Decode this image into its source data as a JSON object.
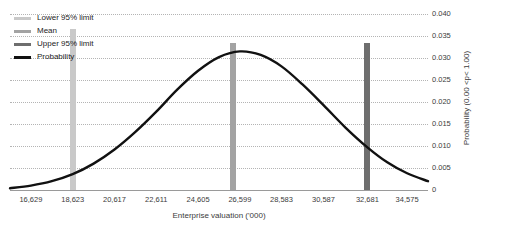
{
  "chart_data": {
    "type": "line",
    "title": "",
    "xlabel": "Enterprise valuation ('000)",
    "ylabel": "Probability (0.00 <p< 1.00)",
    "grid": true,
    "legend_position": "top-left",
    "xlim": [
      15632,
      35572
    ],
    "ylim": [
      0,
      0.04
    ],
    "x_tick_labels": [
      "16,629",
      "18,623",
      "20,617",
      "22,611",
      "24,605",
      "26,599",
      "28,583",
      "30,587",
      "32,681",
      "34,575"
    ],
    "x_tick_values": [
      16629,
      18623,
      20617,
      22611,
      24605,
      26599,
      28583,
      30587,
      32681,
      34575
    ],
    "y_tick_labels": [
      "0",
      "0.005",
      "0.010",
      "0.015",
      "0.020",
      "0.025",
      "0.030",
      "0.035",
      "0.040"
    ],
    "y_tick_values": [
      0,
      0.005,
      0.01,
      0.015,
      0.02,
      0.025,
      0.03,
      0.035,
      0.04
    ],
    "series": [
      {
        "name": "Probability",
        "type": "line",
        "color": "#111111",
        "x": [
          15632,
          16629,
          17626,
          18623,
          19620,
          20617,
          21614,
          22611,
          23608,
          24605,
          25602,
          26599,
          27591,
          28583,
          29585,
          30587,
          31634,
          32681,
          33628,
          34575,
          35572
        ],
        "values": [
          0.0004,
          0.001,
          0.002,
          0.0036,
          0.006,
          0.0092,
          0.0132,
          0.0178,
          0.0228,
          0.0271,
          0.0302,
          0.0315,
          0.0307,
          0.0281,
          0.024,
          0.0193,
          0.0142,
          0.0097,
          0.0063,
          0.0038,
          0.002
        ]
      }
    ],
    "markers": [
      {
        "name": "Lower 95% limit",
        "x": 18623,
        "color": "#c9c9c9",
        "top_value": 0.0365
      },
      {
        "name": "Mean",
        "x": 26270,
        "color": "#a3a3a3",
        "top_value": 0.0335
      },
      {
        "name": "Upper 95% limit",
        "x": 32681,
        "color": "#6e6e6e",
        "top_value": 0.0335
      }
    ],
    "legend": [
      {
        "label": "Lower 95% limit",
        "color": "#c9c9c9"
      },
      {
        "label": "Mean",
        "color": "#a3a3a3"
      },
      {
        "label": "Upper 95% limit",
        "color": "#6e6e6e"
      },
      {
        "label": "Probability",
        "color": "#111111"
      }
    ]
  }
}
